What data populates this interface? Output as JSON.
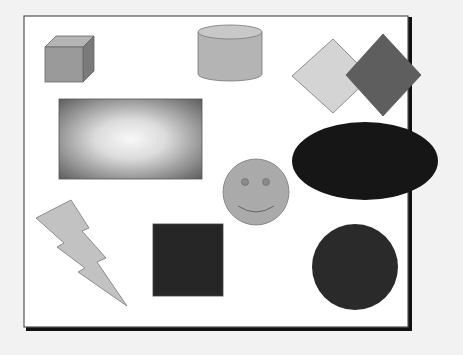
{
  "canvas": {
    "background": "#f2f2f2",
    "frame_fill": "#ffffff",
    "frame_stroke": "#555555",
    "frame_shadow": "#111111"
  },
  "shapes": [
    {
      "id": "cube",
      "label": "Cube",
      "fill": "#9a9a9a",
      "top_fill": "#b5b5b5",
      "side_fill": "#7a7a7a"
    },
    {
      "id": "cylinder",
      "label": "Cylinder",
      "fill": "#b4b4b4",
      "top_fill": "#c8c8c8"
    },
    {
      "id": "diamond-light",
      "label": "Light diamond",
      "fill": "#d4d4d4"
    },
    {
      "id": "diamond-dark",
      "label": "Dark diamond",
      "fill": "#5e5e5e"
    },
    {
      "id": "gradient-rectangle",
      "label": "Gradient rectangle",
      "fill_outer": "#6a6a6a",
      "fill_inner": "#f8f8f8"
    },
    {
      "id": "ellipse",
      "label": "Ellipse",
      "fill": "#161616"
    },
    {
      "id": "smiley-face",
      "label": "Smiley face",
      "fill": "#aaaaaa"
    },
    {
      "id": "lightning-bolt",
      "label": "Lightning bolt",
      "fill": "#c2c2c2"
    },
    {
      "id": "square",
      "label": "Square",
      "fill": "#262626"
    },
    {
      "id": "circle",
      "label": "Circle",
      "fill": "#2a2a2a"
    }
  ]
}
